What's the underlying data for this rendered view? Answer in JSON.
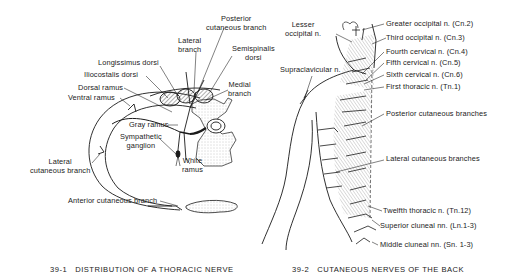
{
  "figure_1": {
    "number": "39-1",
    "caption": "DISTRIBUTION OF A THORACIC NERVE",
    "labels": {
      "posterior_cutaneous_branch": [
        "Posterior",
        "cutaneous branch"
      ],
      "lateral_branch": [
        "Lateral",
        "branch"
      ],
      "semispinalis_dorsi": [
        "Semispinalis",
        "dorsi"
      ],
      "longissimus_dorsi": "Longissimus dorsi",
      "iliocostalis_dorsi": "Iliocostalis dorsi",
      "dorsal_ramus": "Dorsal ramus",
      "ventral_ramus": "Ventral ramus",
      "medial_branch": [
        "Medial",
        "branch"
      ],
      "gray_ramus": "Gray ramus",
      "sympathetic_ganglion": [
        "Sympathetic",
        "ganglion"
      ],
      "white_ramus": [
        "White",
        "ramus"
      ],
      "lateral_cutaneous_branch": [
        "Lateral",
        "cutaneous branch"
      ],
      "anterior_cutaneous_branch": "Anterior cutaneous branch"
    }
  },
  "figure_2": {
    "number": "39-2",
    "caption": "CUTANEOUS NERVES OF THE BACK",
    "labels": {
      "lesser_occipital": [
        "Lesser",
        "occipital n."
      ],
      "supraclavicular": "Supraclavicular n.",
      "greater_occipital": "Greater occipital n. (Cn.2)",
      "third_occipital": "Third occipital n. (Cn.3)",
      "fourth_cervical": "Fourth cervical n. (Cn.4)",
      "fifth_cervical": "Fifth cervical n. (Cn.5)",
      "sixth_cervical": "Sixth cervical n. (Cn.6)",
      "first_thoracic": "First thoracic n. (Tn.1)",
      "posterior_cutaneous_branches": "Posterior cutaneous branches",
      "lateral_cutaneous_branches": "Lateral cutaneous branches",
      "twelfth_thoracic": "Twelfth thoracic n. (Tn.12)",
      "superior_cluneal": "Superior cluneal nn. (Ln.1-3)",
      "middle_cluneal": "Middle cluneal nn. (Sn. 1-3)"
    }
  },
  "colors": {
    "ink": "#1a1a1a",
    "paper": "#ffffff",
    "stipple": "#d8d8d8"
  }
}
